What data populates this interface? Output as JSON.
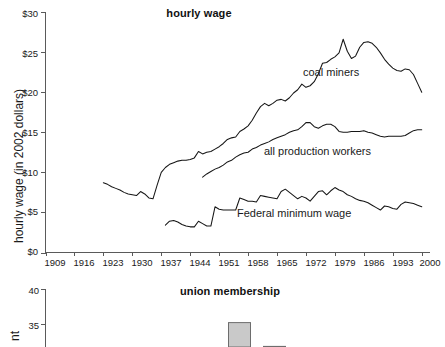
{
  "figure": {
    "background": "#ffffff",
    "line_color": "#161616",
    "axis_color": "#5a5a5a",
    "bar_fill": "#c9c9c9",
    "bar_stroke": "#6d6d6d"
  },
  "chart_data": [
    {
      "type": "line",
      "title": "hourly wage",
      "xlabel": "",
      "ylabel": "hourly wage (in 2002 dollars)",
      "xlim": [
        1909,
        2002
      ],
      "ylim": [
        0,
        30
      ],
      "grid": false,
      "legend": "inline annotations",
      "xticks": [
        1909,
        1916,
        1923,
        1930,
        1937,
        1944,
        1951,
        1958,
        1965,
        1972,
        1979,
        1986,
        1993,
        2000
      ],
      "yticks": [
        0,
        5,
        10,
        15,
        20,
        25,
        30
      ],
      "ytick_labels": [
        "$0",
        "$5",
        "$10",
        "$15",
        "$20",
        "$25",
        "$30"
      ],
      "annotations": [
        {
          "text": "coal miners",
          "x": 1971,
          "y": 22.6
        },
        {
          "text": "all production workers",
          "x": 1963,
          "y": 13.4
        },
        {
          "text": "Federal minimum wage",
          "x": 1957,
          "y": 5.2
        }
      ],
      "series": [
        {
          "name": "coal miners",
          "x": [
            1923,
            1924,
            1925,
            1926,
            1927,
            1928,
            1929,
            1930,
            1931,
            1932,
            1933,
            1934,
            1935,
            1936,
            1937,
            1938,
            1939,
            1940,
            1941,
            1942,
            1943,
            1944,
            1945,
            1946,
            1947,
            1948,
            1949,
            1950,
            1951,
            1952,
            1953,
            1954,
            1955,
            1956,
            1957,
            1958,
            1959,
            1960,
            1961,
            1962,
            1963,
            1964,
            1965,
            1966,
            1967,
            1968,
            1969,
            1970,
            1971,
            1972,
            1973,
            1974,
            1975,
            1976,
            1977,
            1978,
            1979,
            1980,
            1981,
            1982,
            1983,
            1984,
            1985,
            1986,
            1987,
            1988,
            1989,
            1990,
            1991,
            1992,
            1993,
            1994,
            1995,
            1996,
            1997,
            1998,
            1999,
            2000
          ],
          "y": [
            8.7,
            8.5,
            8.2,
            8.0,
            7.8,
            7.5,
            7.3,
            7.2,
            7.1,
            7.6,
            7.3,
            6.8,
            6.7,
            8.4,
            10.0,
            10.6,
            11.0,
            11.2,
            11.4,
            11.5,
            11.5,
            11.6,
            11.8,
            12.6,
            12.3,
            12.5,
            12.6,
            12.9,
            13.2,
            13.6,
            14.1,
            14.3,
            14.4,
            15.1,
            15.4,
            15.8,
            16.5,
            17.4,
            18.2,
            18.6,
            18.3,
            18.6,
            19.0,
            19.1,
            18.9,
            19.3,
            19.9,
            20.3,
            21.0,
            20.6,
            20.8,
            21.3,
            22.3,
            23.6,
            23.7,
            24.1,
            24.4,
            24.9,
            26.6,
            25.1,
            24.2,
            24.5,
            25.6,
            26.2,
            26.3,
            26.1,
            25.6,
            24.9,
            24.1,
            23.5,
            23.0,
            22.7,
            22.6,
            22.9,
            22.8,
            22.2,
            21.1,
            20.0
          ]
        },
        {
          "name": "all production workers",
          "x": [
            1947,
            1948,
            1949,
            1950,
            1951,
            1952,
            1953,
            1954,
            1955,
            1956,
            1957,
            1958,
            1959,
            1960,
            1961,
            1962,
            1963,
            1964,
            1965,
            1966,
            1967,
            1968,
            1969,
            1970,
            1971,
            1972,
            1973,
            1974,
            1975,
            1976,
            1977,
            1978,
            1979,
            1980,
            1981,
            1982,
            1983,
            1984,
            1985,
            1986,
            1987,
            1988,
            1989,
            1990,
            1991,
            1992,
            1993,
            1994,
            1995,
            1996,
            1997,
            1998,
            1999,
            2000
          ],
          "y": [
            9.4,
            9.8,
            10.1,
            10.4,
            10.6,
            10.9,
            11.3,
            11.5,
            11.9,
            12.2,
            12.4,
            12.5,
            12.9,
            13.1,
            13.4,
            13.6,
            13.8,
            14.1,
            14.3,
            14.5,
            14.7,
            15.0,
            15.2,
            15.3,
            15.7,
            16.2,
            16.2,
            15.7,
            15.5,
            15.8,
            16.0,
            16.0,
            15.7,
            15.1,
            15.0,
            15.0,
            15.1,
            15.1,
            15.1,
            15.2,
            15.0,
            14.9,
            14.7,
            14.5,
            14.4,
            14.5,
            14.5,
            14.5,
            14.5,
            14.6,
            14.9,
            15.2,
            15.3,
            15.3
          ]
        },
        {
          "name": "Federal minimum wage",
          "x": [
            1938,
            1939,
            1940,
            1941,
            1942,
            1943,
            1944,
            1945,
            1946,
            1947,
            1948,
            1949,
            1950,
            1951,
            1952,
            1953,
            1954,
            1955,
            1956,
            1957,
            1958,
            1959,
            1960,
            1961,
            1962,
            1963,
            1964,
            1965,
            1966,
            1967,
            1968,
            1969,
            1970,
            1971,
            1972,
            1973,
            1974,
            1975,
            1976,
            1977,
            1978,
            1979,
            1980,
            1981,
            1982,
            1983,
            1984,
            1985,
            1986,
            1987,
            1988,
            1989,
            1990,
            1991,
            1992,
            1993,
            1994,
            1995,
            1996,
            1997,
            1998,
            1999,
            2000
          ],
          "y": [
            3.4,
            3.9,
            4.0,
            3.8,
            3.5,
            3.3,
            3.2,
            3.2,
            3.9,
            3.6,
            3.3,
            3.3,
            5.7,
            5.4,
            5.3,
            5.3,
            5.3,
            5.3,
            6.8,
            6.6,
            6.4,
            6.4,
            6.3,
            7.1,
            7.0,
            6.9,
            6.8,
            6.7,
            7.6,
            7.9,
            7.5,
            7.1,
            6.7,
            7.0,
            6.8,
            6.4,
            7.0,
            7.6,
            7.7,
            7.2,
            7.7,
            8.1,
            7.8,
            7.6,
            7.2,
            7.0,
            6.7,
            6.5,
            6.4,
            6.2,
            5.9,
            5.6,
            5.3,
            5.8,
            5.7,
            5.5,
            5.4,
            6.0,
            6.3,
            6.2,
            6.1,
            5.9,
            5.7
          ]
        }
      ]
    },
    {
      "type": "bar",
      "title": "union membership",
      "xlabel": "",
      "ylabel": "nt",
      "ylim": [
        0,
        40
      ],
      "yticks": [
        35,
        40
      ],
      "ytick_labels": [
        "35",
        "40"
      ],
      "grid": false,
      "categories": [
        "bar-1",
        "bar-2"
      ],
      "values": [
        35.2,
        31.8
      ],
      "note": "chart is cropped at the bottom of the screenshot; only the top of two bars is visible"
    }
  ],
  "top_chart": {
    "title": "hourly wage",
    "y_axis_title": "hourly wage (in 2002 dollars)",
    "y_ticks": [
      "$30",
      "$25",
      "$20",
      "$15",
      "$10",
      "$5",
      "$0"
    ],
    "x_ticks": [
      "1909",
      "1916",
      "1923",
      "1930",
      "1937",
      "1944",
      "1951",
      "1958",
      "1965",
      "1972",
      "1979",
      "1986",
      "1993",
      "2000"
    ],
    "labels": {
      "coal_miners": "coal miners",
      "all_production_workers": "all production workers",
      "federal_minimum_wage": "Federal minimum wage"
    }
  },
  "bottom_chart": {
    "title": "union membership",
    "y_axis_title": "nt",
    "y_ticks": [
      "40",
      "35"
    ]
  }
}
